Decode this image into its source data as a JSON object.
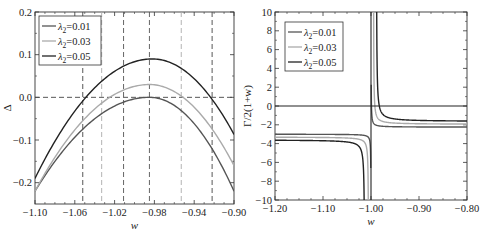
{
  "chart_data": [
    {
      "type": "line",
      "panel": "left",
      "title": "",
      "xlabel": "w",
      "ylabel": "Δ",
      "xlim": [
        -1.1,
        -0.9
      ],
      "ylim": [
        -0.25,
        0.2
      ],
      "xticks": [
        -1.1,
        -1.06,
        -1.02,
        -0.98,
        -0.94,
        -0.9
      ],
      "xtick_labels": [
        "-1.10",
        "-1.06",
        "-1.02",
        "-0.98",
        "-0.94",
        "-0.90"
      ],
      "yticks": [
        -0.2,
        -0.1,
        0.0,
        0.1,
        0.2
      ],
      "ytick_labels": [
        "-0.2",
        "-0.1",
        "0.0",
        "0.1",
        "0.2"
      ],
      "grid": false,
      "legend_position": "upper left",
      "series": [
        {
          "name": "λ2=0.01",
          "color": "#555555",
          "peak_x": -0.985,
          "peak_y": 0.0,
          "x": [
            -1.1,
            -0.9
          ],
          "values_at_ends": [
            -0.22,
            -0.22
          ]
        },
        {
          "name": "λ2=0.03",
          "color": "#aaaaaa",
          "peak_x": -0.985,
          "peak_y": 0.03,
          "x": [
            -1.1,
            -0.9
          ],
          "values_at_ends": [
            -0.22,
            -0.16
          ]
        },
        {
          "name": "λ2=0.05",
          "color": "#222222",
          "peak_x": -0.982,
          "peak_y": 0.09,
          "x": [
            -1.1,
            -0.9
          ],
          "values_at_ends": [
            -0.19,
            -0.087
          ]
        }
      ],
      "annotations": {
        "hline_dashed_y": 0.0,
        "vlines_dashed": [
          {
            "x": -1.052,
            "color": "#444444"
          },
          {
            "x": -1.033,
            "color": "#aaaaaa"
          },
          {
            "x": -1.011,
            "color": "#555555"
          },
          {
            "x": -0.985,
            "color": "#555555"
          },
          {
            "x": -0.953,
            "color": "#aaaaaa"
          },
          {
            "x": -0.922,
            "color": "#444444"
          }
        ]
      }
    },
    {
      "type": "line",
      "panel": "right",
      "title": "",
      "xlabel": "w",
      "ylabel": "Γ/2(1+w)",
      "xlim": [
        -1.2,
        -0.8
      ],
      "ylim": [
        -10,
        10
      ],
      "xticks": [
        -1.2,
        -1.1,
        -1.0,
        -0.9,
        -0.8
      ],
      "xtick_labels": [
        "-1.20",
        "-1.10",
        "-1.00",
        "-0.90",
        "-0.80"
      ],
      "yticks": [
        -10,
        -8,
        -6,
        -4,
        -2,
        0,
        2,
        4,
        6,
        8,
        10
      ],
      "ytick_labels": [
        "-10",
        "-8",
        "-6",
        "-4",
        "-2",
        "0",
        "2",
        "4",
        "6",
        "8",
        "10"
      ],
      "grid": false,
      "legend_position": "upper left",
      "series": [
        {
          "name": "λ2=0.01",
          "color": "#555555",
          "asymptote_left": -3.0,
          "asymptote_right": -2.25,
          "pole_x": -1.0
        },
        {
          "name": "λ2=0.03",
          "color": "#aaaaaa",
          "asymptote_left": -3.3,
          "asymptote_right": -1.95,
          "pole_x": -1.0
        },
        {
          "name": "λ2=0.05",
          "color": "#222222",
          "asymptote_left": -3.6,
          "asymptote_right": -1.65,
          "pole_x": -1.0
        }
      ],
      "annotations": {
        "hline_solid_y": 0,
        "vline_solid_x": -1.0
      }
    }
  ]
}
